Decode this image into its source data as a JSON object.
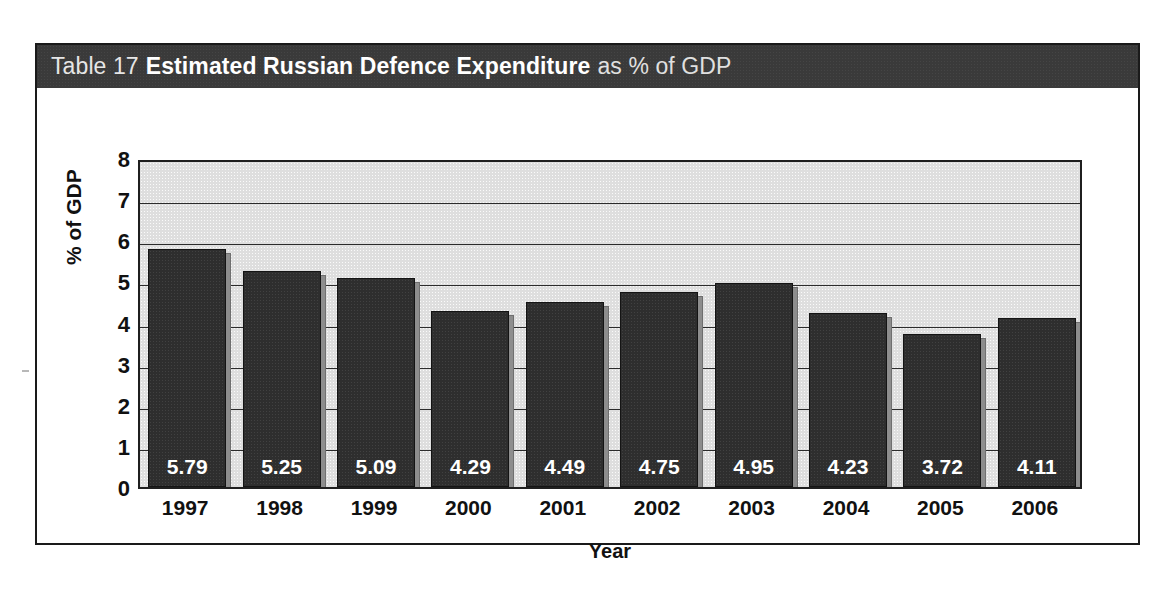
{
  "figure": {
    "table_label": "Table 17",
    "title_bold": "Estimated Russian Defence Expenditure",
    "title_tail": "as % of GDP",
    "band_color": "#3a3a3a",
    "plot_background": "#dedede",
    "bar_color": "#2e2e2e",
    "bar_shadow_color": "#8d8d8d",
    "frame_color": "#1a1a1a"
  },
  "chart_data": {
    "type": "bar",
    "title": "Table 17 Estimated Russian Defence Expenditure as % of GDP",
    "xlabel": "Year",
    "ylabel": "% of GDP",
    "categories": [
      "1997",
      "1998",
      "1999",
      "2000",
      "2001",
      "2002",
      "2003",
      "2004",
      "2005",
      "2006"
    ],
    "values": [
      5.79,
      5.25,
      5.09,
      4.29,
      4.49,
      4.75,
      4.95,
      4.23,
      3.72,
      4.11
    ],
    "value_labels": [
      "5.79",
      "5.25",
      "5.09",
      "4.29",
      "4.49",
      "4.75",
      "4.95",
      "4.23",
      "3.72",
      "4.11"
    ],
    "ylim": [
      0,
      8
    ],
    "yticks": [
      0,
      1,
      2,
      3,
      4,
      5,
      6,
      7,
      8
    ],
    "ytick_labels": [
      "8",
      "7",
      "6",
      "5",
      "4",
      "3",
      "2",
      "1",
      "0"
    ],
    "grid": "horizontal",
    "legend": "none",
    "series_name": "Estimated Russian Defence Expenditure"
  }
}
